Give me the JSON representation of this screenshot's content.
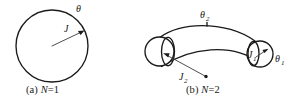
{
  "figure": {
    "background_color": "#ffffff",
    "ink_color": "#1a1a1a",
    "width": 295,
    "height": 107
  },
  "panels": [
    {
      "id": "panel-a",
      "caption": "(a) N=1",
      "caption_prefix": "(a) ",
      "caption_symbol": "N",
      "caption_value": "=1",
      "shape": "circle",
      "labels": [
        {
          "name": "angle-label-theta",
          "text": "θ",
          "subscript": ""
        },
        {
          "name": "current-label-j",
          "text": "J",
          "subscript": ""
        }
      ]
    },
    {
      "id": "panel-b",
      "caption": "(b) N=2",
      "caption_prefix": "(b) ",
      "caption_symbol": "N",
      "caption_value": "=2",
      "shape": "curved-tube",
      "labels": [
        {
          "name": "angle-label-theta-2",
          "text": "θ",
          "subscript": "2"
        },
        {
          "name": "angle-label-theta-1",
          "text": "θ",
          "subscript": "1"
        },
        {
          "name": "current-label-j-1",
          "text": "J",
          "subscript": "1"
        },
        {
          "name": "current-label-j-2",
          "text": "J",
          "subscript": "2"
        }
      ]
    }
  ],
  "glyphs": {
    "theta": "θ",
    "J": "J",
    "N": "N",
    "sub_one": "1",
    "sub_two": "2"
  }
}
